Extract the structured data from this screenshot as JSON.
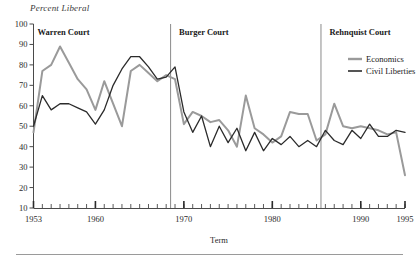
{
  "figure": {
    "y_axis_title": "Percent Liberal",
    "x_axis_title": "Term"
  },
  "eras": [
    {
      "name": "warren",
      "label": "Warren Court",
      "start_year": 1953,
      "end_year": 1968
    },
    {
      "name": "burger",
      "label": "Burger Court",
      "start_year": 1969,
      "end_year": 1985
    },
    {
      "name": "rehnquist",
      "label": "Rehnquist Court",
      "start_year": 1986,
      "end_year": 1995
    }
  ],
  "legend": {
    "position": "top-right",
    "entries": [
      {
        "name": "economics",
        "label": "Economics",
        "color": "#9a9a9a"
      },
      {
        "name": "civil_liberties",
        "label": "Civil Liberties",
        "color": "#2b2b2b"
      }
    ]
  },
  "chart_data": {
    "type": "line",
    "title": "",
    "subtitle": "",
    "xlabel": "Term",
    "ylabel": "Percent Liberal",
    "xlim": [
      1953,
      1995
    ],
    "ylim": [
      10,
      100
    ],
    "yticks": [
      10,
      20,
      30,
      40,
      50,
      60,
      70,
      80,
      90,
      100
    ],
    "ytick_labels": [
      "10",
      "20",
      "30",
      "40",
      "50",
      "60",
      "70",
      "80",
      "90",
      "100"
    ],
    "xticks": [
      1953,
      1960,
      1970,
      1980,
      1990,
      1995
    ],
    "xtick_labels": [
      "1953",
      "1960",
      "1970",
      "1980",
      "1990",
      "1995"
    ],
    "minor_xticks_every": 1,
    "grid": false,
    "legend_position": "top-right",
    "x": [
      1953,
      1954,
      1955,
      1956,
      1957,
      1958,
      1959,
      1960,
      1961,
      1962,
      1963,
      1964,
      1965,
      1966,
      1967,
      1968,
      1969,
      1970,
      1971,
      1972,
      1973,
      1974,
      1975,
      1976,
      1977,
      1978,
      1979,
      1980,
      1981,
      1982,
      1983,
      1984,
      1985,
      1986,
      1987,
      1988,
      1989,
      1990,
      1991,
      1992,
      1993,
      1994,
      1995
    ],
    "series": [
      {
        "name": "Economics",
        "color": "#9a9a9a",
        "values": [
          47,
          77,
          80,
          89,
          81,
          73,
          68,
          58,
          72,
          61,
          50,
          77,
          80,
          76,
          72,
          75,
          73,
          51,
          57,
          55,
          52,
          53,
          48,
          40,
          65,
          49,
          46,
          42,
          45,
          57,
          56,
          56,
          43,
          46,
          61,
          50,
          49,
          50,
          49,
          48,
          46,
          47,
          26
        ]
      },
      {
        "name": "Civil Liberties",
        "color": "#2b2b2b",
        "values": [
          50,
          65,
          58,
          61,
          61,
          59,
          57,
          51,
          58,
          70,
          78,
          84,
          84,
          79,
          73,
          74,
          79,
          57,
          47,
          55,
          40,
          50,
          42,
          49,
          38,
          47,
          38,
          44,
          41,
          45,
          40,
          43,
          40,
          48,
          43,
          41,
          48,
          44,
          51,
          45,
          45,
          48,
          47
        ]
      }
    ],
    "era_dividers": [
      1968.5,
      1985.5
    ]
  },
  "notes": {
    "axis_line_color": "#4a4a4a",
    "divider_color": "#8a8a8a",
    "background": "#ffffff"
  }
}
